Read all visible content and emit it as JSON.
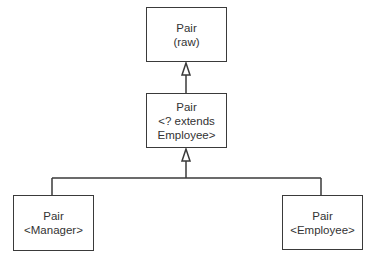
{
  "diagram": {
    "type": "uml-class-hierarchy",
    "colors": {
      "line": "#3a3a3a",
      "text": "#333333",
      "background": "#ffffff"
    },
    "nodes": {
      "raw": {
        "line1": "Pair",
        "line2": "(raw)"
      },
      "wildcard": {
        "line1": "Pair",
        "line2": "<? extends",
        "line3": "Employee>"
      },
      "manager": {
        "line1": "Pair",
        "line2": "<Manager>"
      },
      "employee": {
        "line1": "Pair",
        "line2": "<Employee>"
      }
    },
    "edges": [
      {
        "from": "wildcard",
        "to": "raw",
        "kind": "inheritance"
      },
      {
        "from": "manager",
        "to": "wildcard",
        "kind": "inheritance"
      },
      {
        "from": "employee",
        "to": "wildcard",
        "kind": "inheritance"
      }
    ]
  }
}
